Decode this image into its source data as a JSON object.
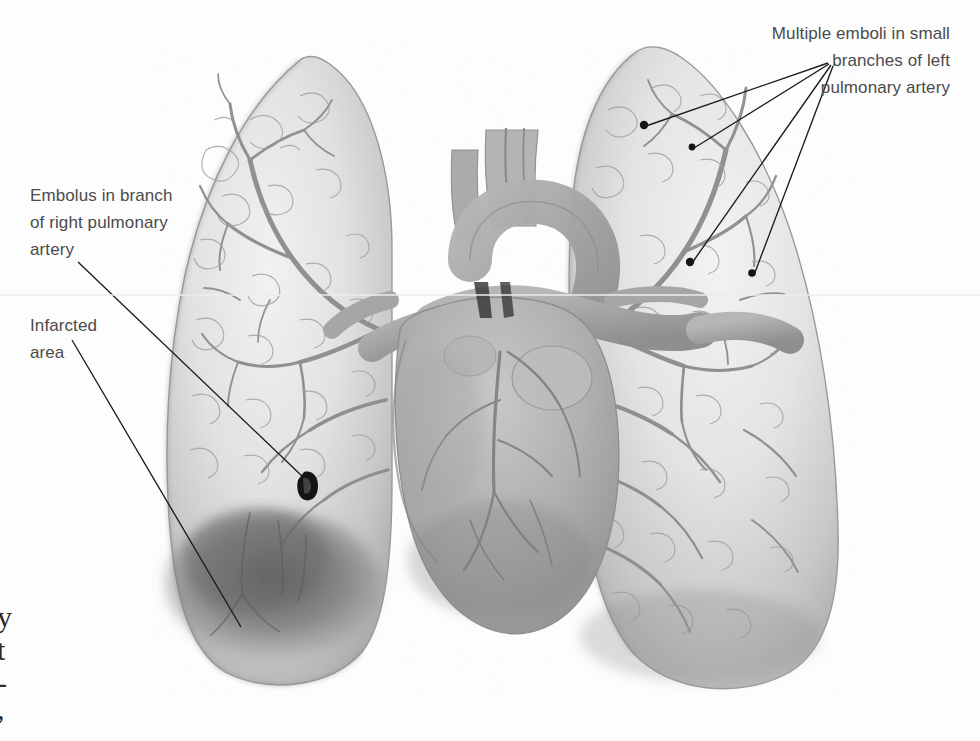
{
  "figure": {
    "type": "anatomical-illustration",
    "rendering": "grayscale halftone medical illustration",
    "background_color": "#fdfdfd",
    "ink_color": "#111111",
    "label_color": "#4b4b4b"
  },
  "labels": {
    "right_embolus": "Embolus in branch\nof right pulmonary\nartery",
    "infarcted_area": "Infarcted\narea",
    "multiple_emboli": "Multiple emboli in small\nbranches of left\npulmonary artery"
  },
  "edge_text_fragments": [
    "y",
    "t",
    "-",
    ","
  ],
  "callouts": [
    {
      "name": "right-pulmonary-artery-embolus",
      "label_anchor": [
        78,
        262
      ],
      "target": [
        308,
        482
      ],
      "marker": "dark-embolus-blob"
    },
    {
      "name": "infarcted-area",
      "label_anchor": [
        72,
        340
      ],
      "target": [
        241,
        627
      ],
      "marker": "none"
    },
    {
      "name": "left-emboli-1",
      "label_anchor": [
        830,
        62
      ],
      "target": [
        644,
        125
      ],
      "marker": "dot"
    },
    {
      "name": "left-emboli-2",
      "label_anchor": [
        830,
        62
      ],
      "target": [
        692,
        147
      ],
      "marker": "dot"
    },
    {
      "name": "left-emboli-3",
      "label_anchor": [
        830,
        62
      ],
      "target": [
        691,
        262
      ],
      "marker": "dot"
    },
    {
      "name": "left-emboli-4",
      "label_anchor": [
        830,
        62
      ],
      "target": [
        752,
        274
      ],
      "marker": "dot"
    }
  ],
  "anatomy": {
    "right_lung": {
      "name": "Right lung (viewer left)",
      "shading": "light gray with vascular tree"
    },
    "left_lung": {
      "name": "Left lung (viewer right)",
      "shading": "light gray with vascular tree"
    },
    "heart": {
      "name": "Heart",
      "shading": "medium gray central mass"
    },
    "great_vessels": {
      "name": "Aortic arch, pulmonary trunk and great vessels"
    },
    "infarct_zone": {
      "name": "Infarcted area",
      "shading": "dark wedge in right lung base"
    }
  },
  "artifacts": {
    "scan_line": {
      "present": true,
      "y": 295,
      "color": "#ededed"
    }
  }
}
